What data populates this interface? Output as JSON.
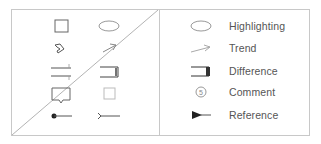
{
  "legend": {
    "items": [
      {
        "icon": "ellipse-icon",
        "label": "Highlighting"
      },
      {
        "icon": "arrow-icon",
        "label": "Trend"
      },
      {
        "icon": "bracket-icon",
        "label": "Difference"
      },
      {
        "icon": "numbered-circle-icon",
        "label": "Comment",
        "number": "5"
      },
      {
        "icon": "triangle-line-icon",
        "label": "Reference"
      }
    ]
  },
  "left_panel": {
    "icons": [
      "square-icon",
      "ellipse-icon",
      "chevron-shape-icon",
      "arrow-icon",
      "double-line-marker-icon",
      "bracket-icon",
      "callout-icon",
      "light-square-icon",
      "dot-line-icon",
      "fork-line-icon"
    ]
  },
  "colors": {
    "stroke": "#8a8a8a",
    "dark": "#333333",
    "light": "#bbbbbb",
    "border": "#c8c8c8",
    "text": "#555555"
  }
}
